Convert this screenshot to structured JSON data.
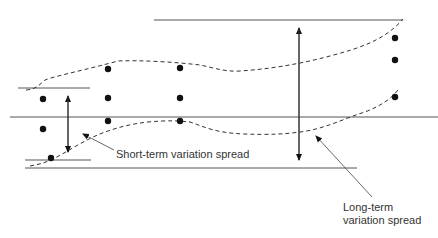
{
  "diagram": {
    "colors": {
      "line": "#555555",
      "dot": "#111111",
      "text": "#333333",
      "background": "#ffffff"
    },
    "labels": {
      "short_term": "Short-term variation spread",
      "long_term_line1": "Long-term",
      "long_term_line2": "variation spread"
    },
    "points": [
      {
        "x": 43,
        "y": 99
      },
      {
        "x": 43,
        "y": 129
      },
      {
        "x": 51,
        "y": 158
      },
      {
        "x": 108,
        "y": 69
      },
      {
        "x": 108,
        "y": 98
      },
      {
        "x": 108,
        "y": 121
      },
      {
        "x": 180,
        "y": 68
      },
      {
        "x": 180,
        "y": 98
      },
      {
        "x": 180,
        "y": 121
      },
      {
        "x": 395,
        "y": 38
      },
      {
        "x": 395,
        "y": 60
      },
      {
        "x": 395,
        "y": 97
      }
    ]
  }
}
